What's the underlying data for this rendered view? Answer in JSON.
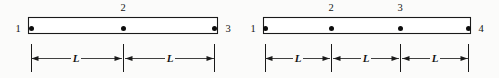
{
  "figure": {
    "background_color": "#fbfbfa",
    "line_color": "#1a1a1a",
    "elements": [
      {
        "id": "left-element",
        "name": "two-node-spacing-bar",
        "bar": {
          "x": 28,
          "y": 17,
          "width": 189,
          "height": 16
        },
        "nodes": [
          {
            "label": "1",
            "x": 31,
            "y": 28,
            "label_x": 18,
            "label_y": 32,
            "label_position": "left"
          },
          {
            "label": "2",
            "x": 123,
            "y": 28,
            "label_x": 123,
            "label_y": 11,
            "label_position": "above"
          },
          {
            "label": "3",
            "x": 214,
            "y": 28,
            "label_x": 228,
            "label_y": 32,
            "label_position": "right"
          }
        ],
        "dimensions": [
          {
            "label": "L",
            "x1": 31,
            "x2": 122,
            "y": 58,
            "label_x": 76,
            "label_y": 62
          },
          {
            "label": "L",
            "x1": 125,
            "x2": 214,
            "y": 58,
            "label_x": 170,
            "label_y": 62
          }
        ],
        "extension_lines": [
          {
            "x": 31,
            "y1": 44,
            "y2": 72
          },
          {
            "x": 123,
            "y1": 44,
            "y2": 72
          },
          {
            "x": 214,
            "y1": 44,
            "y2": 72
          }
        ]
      },
      {
        "id": "right-element",
        "name": "three-node-spacing-bar",
        "bar": {
          "x": 263,
          "y": 17,
          "width": 207,
          "height": 16
        },
        "nodes": [
          {
            "label": "1",
            "x": 265,
            "y": 28,
            "label_x": 253,
            "label_y": 32,
            "label_position": "left"
          },
          {
            "label": "2",
            "x": 331,
            "y": 28,
            "label_x": 331,
            "label_y": 11,
            "label_position": "above"
          },
          {
            "label": "3",
            "x": 400,
            "y": 28,
            "label_x": 400,
            "label_y": 11,
            "label_position": "above"
          },
          {
            "label": "4",
            "x": 468,
            "y": 28,
            "label_x": 481,
            "label_y": 32,
            "label_position": "right"
          }
        ],
        "dimensions": [
          {
            "label": "L",
            "x1": 265,
            "x2": 330,
            "y": 58,
            "label_x": 298,
            "label_y": 62
          },
          {
            "label": "L",
            "x1": 333,
            "x2": 399,
            "y": 58,
            "label_x": 366,
            "label_y": 62
          },
          {
            "label": "L",
            "x1": 402,
            "x2": 468,
            "y": 58,
            "label_x": 435,
            "label_y": 62
          }
        ],
        "extension_lines": [
          {
            "x": 265,
            "y1": 44,
            "y2": 72
          },
          {
            "x": 331,
            "y1": 44,
            "y2": 72
          },
          {
            "x": 400,
            "y1": 44,
            "y2": 72
          },
          {
            "x": 468,
            "y1": 44,
            "y2": 72
          }
        ]
      }
    ]
  }
}
